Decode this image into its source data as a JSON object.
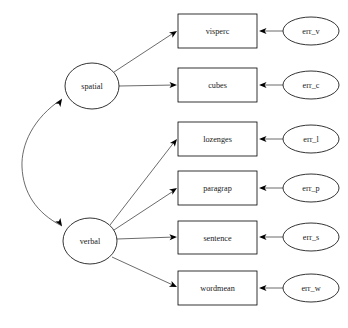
{
  "diagram": {
    "type": "sem-path-diagram",
    "background_color": "#ffffff",
    "stroke_color": "#000000",
    "line_color": "#3a3a3a",
    "canvas": {
      "width": 348,
      "height": 328
    }
  },
  "latents": [
    {
      "id": "spatial",
      "label": "spatial",
      "shape": "ellipse",
      "cx": 92,
      "cy": 86,
      "rx": 27,
      "ry": 23
    },
    {
      "id": "verbal",
      "label": "verbal",
      "shape": "ellipse",
      "cx": 90,
      "cy": 241,
      "rx": 27,
      "ry": 23
    }
  ],
  "observed": [
    {
      "id": "visperc",
      "label": "visperc",
      "shape": "rect",
      "x": 178,
      "y": 14,
      "w": 79,
      "h": 34,
      "from": "spatial"
    },
    {
      "id": "cubes",
      "label": "cubes",
      "shape": "rect",
      "x": 178,
      "y": 68,
      "w": 79,
      "h": 34,
      "from": "spatial"
    },
    {
      "id": "lozenges",
      "label": "lozenges",
      "shape": "rect",
      "x": 178,
      "y": 122,
      "w": 79,
      "h": 34,
      "from": "verbal"
    },
    {
      "id": "paragrap",
      "label": "paragrap",
      "shape": "rect",
      "x": 178,
      "y": 171,
      "w": 79,
      "h": 34,
      "from": "verbal"
    },
    {
      "id": "sentence",
      "label": "sentence",
      "shape": "rect",
      "x": 178,
      "y": 221,
      "w": 79,
      "h": 33,
      "from": "verbal"
    },
    {
      "id": "wordmean",
      "label": "wordmean",
      "shape": "rect",
      "x": 178,
      "y": 271,
      "w": 79,
      "h": 34,
      "from": "verbal"
    }
  ],
  "errors": [
    {
      "id": "err_v",
      "label": "err_v",
      "shape": "ellipse",
      "cx": 311,
      "cy": 31,
      "rx": 28,
      "ry": 14,
      "to": "visperc"
    },
    {
      "id": "err_c",
      "label": "err_c",
      "shape": "ellipse",
      "cx": 311,
      "cy": 85,
      "rx": 28,
      "ry": 14,
      "to": "cubes"
    },
    {
      "id": "err_l",
      "label": "err_l",
      "shape": "ellipse",
      "cx": 311,
      "cy": 139,
      "rx": 28,
      "ry": 14,
      "to": "lozenges"
    },
    {
      "id": "err_p",
      "label": "err_p",
      "shape": "ellipse",
      "cx": 311,
      "cy": 188,
      "rx": 28,
      "ry": 14,
      "to": "paragrap"
    },
    {
      "id": "err_s",
      "label": "err_s",
      "shape": "ellipse",
      "cx": 311,
      "cy": 237,
      "rx": 28,
      "ry": 14,
      "to": "sentence"
    },
    {
      "id": "err_w",
      "label": "err_w",
      "shape": "ellipse",
      "cx": 311,
      "cy": 288,
      "rx": 28,
      "ry": 14,
      "to": "wordmean"
    }
  ],
  "covariance": {
    "id": "spatial-verbal-covariance",
    "between": [
      "spatial",
      "verbal"
    ],
    "style": "double-headed-curved-arrow",
    "path": "M 62,99 C 33,118 21,145 22,167 C 23,192 36,213 62,226",
    "head_top": {
      "x": 62,
      "y": 99,
      "angle": -56
    },
    "head_bottom": {
      "x": 62,
      "y": 226,
      "angle": 56
    }
  },
  "loadings": [
    {
      "id": "spatial-visperc",
      "d": "M 114,72 L 175,32",
      "head": {
        "x": 177,
        "y": 31,
        "angle": -33
      }
    },
    {
      "id": "spatial-cubes",
      "d": "M 119,86 L 175,85",
      "head": {
        "x": 177,
        "y": 85,
        "angle": 0
      }
    },
    {
      "id": "verbal-lozenges",
      "d": "M 110,225 L 175,141",
      "head": {
        "x": 177,
        "y": 139,
        "angle": -52
      }
    },
    {
      "id": "verbal-paragrap",
      "d": "M 114,230 L 175,190",
      "head": {
        "x": 177,
        "y": 188,
        "angle": -33
      }
    },
    {
      "id": "verbal-sentence",
      "d": "M 117,239 L 175,237",
      "head": {
        "x": 177,
        "y": 237,
        "angle": -2
      }
    },
    {
      "id": "verbal-wordmean",
      "d": "M 112,257 L 175,286",
      "head": {
        "x": 177,
        "y": 287,
        "angle": 25
      }
    }
  ],
  "error_arrows": [
    {
      "id": "err_v-visperc",
      "d": "M 283,31 L 261,31",
      "head": {
        "x": 259,
        "y": 31,
        "angle": 180
      }
    },
    {
      "id": "err_c-cubes",
      "d": "M 283,85 L 261,85",
      "head": {
        "x": 259,
        "y": 85,
        "angle": 180
      }
    },
    {
      "id": "err_l-lozenges",
      "d": "M 283,139 L 261,139",
      "head": {
        "x": 259,
        "y": 139,
        "angle": 180
      }
    },
    {
      "id": "err_p-paragrap",
      "d": "M 283,188 L 261,188",
      "head": {
        "x": 259,
        "y": 188,
        "angle": 180
      }
    },
    {
      "id": "err_s-sentence",
      "d": "M 283,237 L 261,237",
      "head": {
        "x": 259,
        "y": 237,
        "angle": 180
      }
    },
    {
      "id": "err_w-wordmean",
      "d": "M 283,288 L 261,288",
      "head": {
        "x": 259,
        "y": 288,
        "angle": 180
      }
    }
  ]
}
